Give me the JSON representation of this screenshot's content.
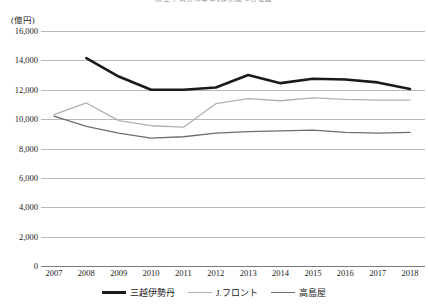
{
  "chart_data": {
    "type": "line",
    "title": "図表 1 百貨店大手3社の売上高推移",
    "unit_label": "(億円)",
    "xlabel": "",
    "ylabel": "",
    "categories": [
      "2007",
      "2008",
      "2009",
      "2010",
      "2011",
      "2012",
      "2013",
      "2014",
      "2015",
      "2016",
      "2017",
      "2018"
    ],
    "ylim": [
      0,
      16000
    ],
    "yticks": [
      "0",
      "2,000",
      "4,000",
      "6,000",
      "8,000",
      "10,000",
      "12,000",
      "14,000",
      "16,000"
    ],
    "ytick_values": [
      0,
      2000,
      4000,
      6000,
      8000,
      10000,
      12000,
      14000,
      16000
    ],
    "grid": true,
    "legend_position": "bottom",
    "series": [
      {
        "name": "三越伊勢丹",
        "color": "#1a1a1a",
        "width": 2.6,
        "values": [
          null,
          14150,
          12900,
          12000,
          12000,
          12150,
          13000,
          12450,
          12750,
          12700,
          12500,
          12050
        ]
      },
      {
        "name": "J.フロント",
        "color": "#b0b0b0",
        "width": 1.3,
        "values": [
          10300,
          11100,
          9900,
          9550,
          9450,
          11050,
          11400,
          11250,
          11450,
          11350,
          11300,
          11300
        ]
      },
      {
        "name": "高島屋",
        "color": "#6e6e6e",
        "width": 1.3,
        "values": [
          10200,
          9500,
          9050,
          8700,
          8800,
          9050,
          9150,
          9200,
          9250,
          9100,
          9050,
          9100
        ]
      }
    ]
  }
}
